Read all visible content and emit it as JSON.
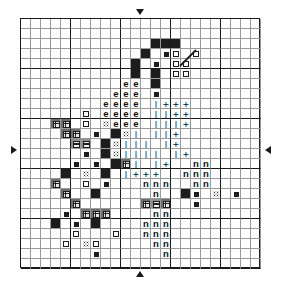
{
  "chart_data": {
    "type": "heatmap",
    "title": "",
    "subtitle": "",
    "xlabel": "",
    "ylabel": "",
    "grid": true,
    "legend_position": "none",
    "cols": 24,
    "rows": 25,
    "cell_px": 10,
    "major_every": 5,
    "symbol_legend": [
      {
        "key": "F",
        "name": "filled-square",
        "glyph": "■"
      },
      {
        "key": "D",
        "name": "center-dot",
        "glyph": "•"
      },
      {
        "key": "O",
        "name": "open-square",
        "glyph": "□"
      },
      {
        "key": "G",
        "name": "gridded-square",
        "glyph": "⊞"
      },
      {
        "key": "H",
        "name": "barred-square",
        "glyph": "≡"
      },
      {
        "key": "S",
        "name": "stippled-square",
        "glyph": "∷"
      },
      {
        "key": "e",
        "name": "letter-e",
        "glyph": "e"
      },
      {
        "key": "I",
        "name": "vertical-bar",
        "glyph": "|"
      },
      {
        "key": "P",
        "name": "plus-sign",
        "glyph": "+"
      },
      {
        "key": "n",
        "name": "letter-n",
        "glyph": "n"
      }
    ],
    "center_markers": {
      "top": {
        "icon": "arrow-down-marker",
        "col": 12
      },
      "bottom": {
        "icon": "arrow-up-marker",
        "col": 12
      },
      "left": {
        "icon": "arrow-right-marker",
        "row": 13
      },
      "right": {
        "icon": "arrow-left-marker",
        "row": 13
      }
    },
    "backstitch_lines": [
      {
        "x1": 160,
        "y1": 48,
        "x2": 176,
        "y2": 32
      }
    ],
    "matrix": [
      "........................",
      "........................",
      ".............FFF........",
      "............F.DO.O......",
      "...........F.D.OO.......",
      "...........F.F.OO.......",
      "..........ee.F..........",
      ".........eee.D..........",
      "........eeee.IPPP.......",
      "......O.eeee.IIPP.......",
      "...GG.O.Seee.IIIP.......",
      "....GG.D.FSI.IIP........",
      ".....HH.FSIII.IP........",
      "......D.FSIIII.IP.......",
      ".....D.D.FGI.IP..nn.....",
      "....F.S.F.IPPP..nnn.....",
      "...G..O.D...nnn..nno....",
      "....G..F.....n..FD.S.D..",
      ".....G......GHG..D......",
      "....D.GGG....nn.........",
      "...F.D.F....nnn.........",
      ".....O...O..nnn.........",
      "....O.SO.....nn.........",
      ".......D......n.........",
      "........................"
    ]
  },
  "chart": {
    "id": "cross-stitch-pattern",
    "accent_color": "#1d1d1d",
    "grid_minor_color": "#9a9a9a",
    "grid_major_color": "#1a1a1a",
    "background_color": "#ffffff"
  }
}
